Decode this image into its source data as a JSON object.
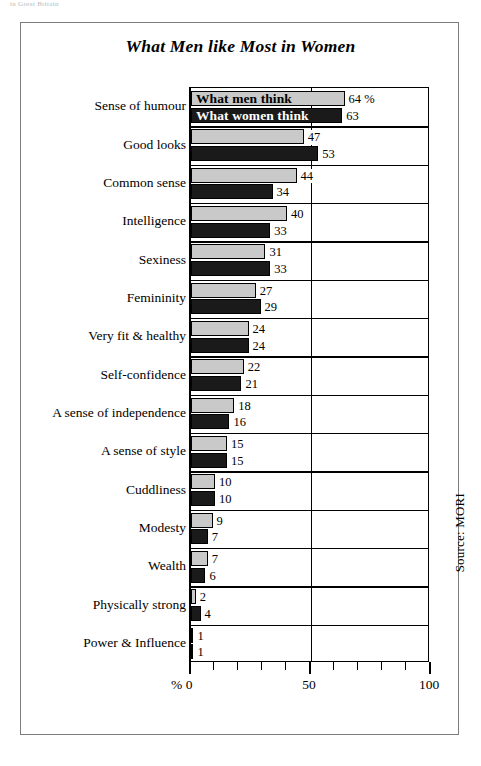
{
  "page": {
    "top_fragment": "in Great Britain"
  },
  "chart_data": {
    "type": "bar",
    "orientation": "horizontal",
    "title": "What Men like Most in Women",
    "xlabel": "%",
    "ylabel": "",
    "xlim": [
      0,
      100
    ],
    "grid": true,
    "gridlines": [
      0,
      50,
      100
    ],
    "tick_step": 10,
    "tick_labels": [
      "0",
      "50",
      "100"
    ],
    "percent_prefix": "%",
    "first_value_suffix": " %",
    "legend_position": "overlay-first-row",
    "source_note": "Source: MORI",
    "categories": [
      "Sense of humour",
      "Good looks",
      "Common sense",
      "Intelligence",
      "Sexiness",
      "Femininity",
      "Very fit & healthy",
      "Self-confidence",
      "A sense of independence",
      "A sense of style",
      "Cuddliness",
      "Modesty",
      "Wealth",
      "Physically strong",
      "Power & Influence"
    ],
    "series": [
      {
        "name": "What men think",
        "color": "#c9c9c9",
        "values": [
          64,
          47,
          44,
          40,
          31,
          27,
          24,
          22,
          18,
          15,
          10,
          9,
          7,
          2,
          1
        ],
        "labels": [
          "64 %",
          "47",
          "44",
          "40",
          "31",
          "27",
          "24",
          "22",
          "18",
          "15",
          "10",
          "9",
          "7",
          "2",
          "1"
        ]
      },
      {
        "name": "What women think",
        "color": "#1a1a1a",
        "values": [
          63,
          53,
          34,
          33,
          33,
          29,
          24,
          21,
          16,
          15,
          10,
          7,
          6,
          4,
          1
        ],
        "labels": [
          "63",
          "53",
          "34",
          "33",
          "33",
          "29",
          "24",
          "21",
          "16",
          "15",
          "10",
          "7",
          "6",
          "4",
          "1"
        ]
      }
    ]
  }
}
